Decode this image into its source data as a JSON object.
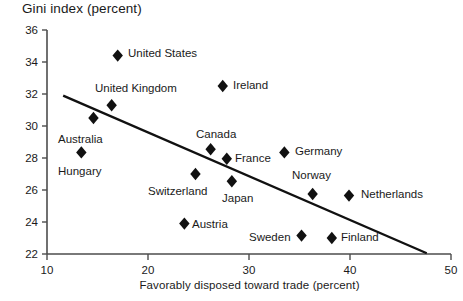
{
  "chart_data": {
    "type": "scatter",
    "title": "Gini index (percent)",
    "xlabel": "Favorably disposed toward trade (percent)",
    "ylabel": "Gini index (percent)",
    "xlim": [
      10,
      50
    ],
    "ylim": [
      22,
      36
    ],
    "xticks": [
      10,
      20,
      30,
      40,
      50
    ],
    "yticks": [
      22,
      24,
      26,
      28,
      30,
      32,
      34,
      36
    ],
    "grid": false,
    "legend": null,
    "marker": "filled-diamond",
    "marker_color": "#111111",
    "trendline": {
      "label": "linear fit",
      "color": "#111111",
      "x": [
        11.6,
        47.6
      ],
      "y": [
        31.9,
        22.05
      ]
    },
    "points": [
      {
        "name": "United States",
        "x": 17.0,
        "y": 34.4,
        "label_side": "right"
      },
      {
        "name": "United Kingdom",
        "x": 16.4,
        "y": 31.3,
        "label_side": "above"
      },
      {
        "name": "Australia",
        "x": 14.6,
        "y": 30.5,
        "label_side": "below-left"
      },
      {
        "name": "Hungary",
        "x": 13.4,
        "y": 28.35,
        "label_side": "below"
      },
      {
        "name": "Ireland",
        "x": 27.4,
        "y": 32.5,
        "label_side": "right"
      },
      {
        "name": "Canada",
        "x": 26.2,
        "y": 28.55,
        "label_side": "above"
      },
      {
        "name": "France",
        "x": 27.8,
        "y": 27.95,
        "label_side": "right"
      },
      {
        "name": "Switzerland",
        "x": 24.7,
        "y": 27.0,
        "label_side": "below"
      },
      {
        "name": "Japan",
        "x": 28.3,
        "y": 26.55,
        "label_side": "below"
      },
      {
        "name": "Austria",
        "x": 23.6,
        "y": 23.9,
        "label_side": "right"
      },
      {
        "name": "Germany",
        "x": 33.5,
        "y": 28.35,
        "label_side": "right"
      },
      {
        "name": "Norway",
        "x": 36.3,
        "y": 25.75,
        "label_side": "above"
      },
      {
        "name": "Netherlands",
        "x": 39.9,
        "y": 25.65,
        "label_side": "right"
      },
      {
        "name": "Sweden",
        "x": 35.2,
        "y": 23.15,
        "label_side": "left"
      },
      {
        "name": "Finland",
        "x": 38.2,
        "y": 23.0,
        "label_side": "right"
      }
    ]
  },
  "layout": {
    "plot_left_px": 47,
    "plot_right_px": 451,
    "plot_top_px": 30,
    "plot_bottom_px": 254,
    "label_positions": {
      "United States": {
        "lx": 128,
        "ly": 57
      },
      "United Kingdom": {
        "lx": 95,
        "ly": 92
      },
      "Australia": {
        "lx": 58,
        "ly": 143
      },
      "Hungary": {
        "lx": 58,
        "ly": 175
      },
      "Ireland": {
        "lx": 233,
        "ly": 89
      },
      "Canada": {
        "lx": 196,
        "ly": 138
      },
      "France": {
        "lx": 235,
        "ly": 162
      },
      "Switzerland": {
        "lx": 148,
        "ly": 195
      },
      "Japan": {
        "lx": 222,
        "ly": 202
      },
      "Austria": {
        "lx": 192,
        "ly": 228
      },
      "Germany": {
        "lx": 295,
        "ly": 155
      },
      "Norway": {
        "lx": 292,
        "ly": 179
      },
      "Netherlands": {
        "lx": 361,
        "ly": 198
      },
      "Sweden": {
        "lx": 249,
        "ly": 241
      },
      "Finland": {
        "lx": 341,
        "ly": 241
      }
    }
  }
}
